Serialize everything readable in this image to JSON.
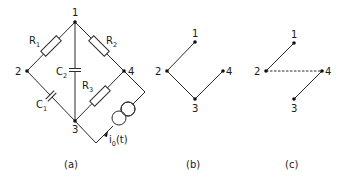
{
  "figure": {
    "panels": [
      {
        "id": "a",
        "caption": "(a)",
        "type": "circuit",
        "nodes": [
          "1",
          "2",
          "3",
          "4"
        ],
        "components": [
          {
            "name": "R",
            "sub": "1",
            "kind": "resistor",
            "between": [
              "1",
              "2"
            ]
          },
          {
            "name": "R",
            "sub": "2",
            "kind": "resistor",
            "between": [
              "1",
              "4"
            ]
          },
          {
            "name": "C",
            "sub": "2",
            "kind": "capacitor",
            "between": [
              "1",
              "3"
            ]
          },
          {
            "name": "C",
            "sub": "1",
            "kind": "capacitor",
            "between": [
              "2",
              "3"
            ]
          },
          {
            "name": "R",
            "sub": "3",
            "kind": "resistor",
            "between": [
              "3",
              "4"
            ]
          },
          {
            "name": "i",
            "sub": "0",
            "suffix": "(t)",
            "kind": "current-source",
            "between": [
              "3",
              "4"
            ]
          }
        ]
      },
      {
        "id": "b",
        "caption": "(b)",
        "type": "graph",
        "nodes": [
          "1",
          "2",
          "3",
          "4"
        ],
        "edges": [
          {
            "from": "1",
            "to": "2",
            "style": "solid"
          },
          {
            "from": "2",
            "to": "3",
            "style": "solid"
          },
          {
            "from": "3",
            "to": "4",
            "style": "solid"
          }
        ]
      },
      {
        "id": "c",
        "caption": "(c)",
        "type": "graph",
        "nodes": [
          "1",
          "2",
          "3",
          "4"
        ],
        "edges": [
          {
            "from": "1",
            "to": "2",
            "style": "solid"
          },
          {
            "from": "2",
            "to": "4",
            "style": "dashed"
          },
          {
            "from": "4",
            "to": "3",
            "style": "solid"
          }
        ]
      }
    ]
  }
}
